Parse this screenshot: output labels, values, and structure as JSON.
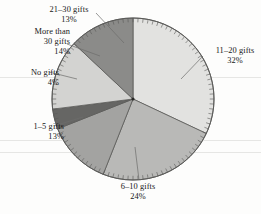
{
  "chart_data": {
    "type": "pie",
    "title": "",
    "xlabel": "",
    "ylabel": "",
    "legend_position": "none",
    "grid": false,
    "note": "Grayscale pie chart with radial tick marks around the rim and leader-line callout labels.",
    "categories": [
      "11–20 gifts",
      "6–10 gifts",
      "1–5 gifts",
      "No gifts",
      "More than 30 gifts",
      "21–30 gifts"
    ],
    "values": [
      32,
      24,
      13,
      4,
      14,
      13
    ],
    "value_unit": "%",
    "slices": [
      {
        "label": "11–20 gifts",
        "percent_label": "32%",
        "value": 32,
        "color": "#e2e2e0",
        "start_angle_deg": 0,
        "end_angle_deg": 115.2
      },
      {
        "label": "6–10 gifts",
        "percent_label": "24%",
        "value": 24,
        "color": "#b9b9b7",
        "start_angle_deg": 115.2,
        "end_angle_deg": 201.6
      },
      {
        "label": "1–5 gifts",
        "percent_label": "13%",
        "value": 13,
        "color": "#a3a3a1",
        "start_angle_deg": 201.6,
        "end_angle_deg": 248.4
      },
      {
        "label": "No gifts",
        "percent_label": "4%",
        "value": 4,
        "color": "#666664",
        "start_angle_deg": 248.4,
        "end_angle_deg": 262.8
      },
      {
        "label": "More than 30 gifts",
        "percent_label": "14%",
        "value": 14,
        "color": "#d3d3d1",
        "start_angle_deg": 262.8,
        "end_angle_deg": 313.2
      },
      {
        "label": "21–30 gifts",
        "percent_label": "13%",
        "value": 13,
        "color": "#8b8b89",
        "start_angle_deg": 313.2,
        "end_angle_deg": 360
      }
    ]
  },
  "labels": {
    "gifts_21_30": {
      "name": "21–30 gifts",
      "percent": "13%"
    },
    "more_than_30": {
      "name_line1": "More than",
      "name_line2": "30 gifts",
      "percent": "14%"
    },
    "no_gifts": {
      "name": "No gifts",
      "percent": "4%"
    },
    "gifts_1_5": {
      "name": "1–5 gifts",
      "percent": "13%"
    },
    "gifts_6_10": {
      "name": "6–10 gifts",
      "percent": "24%"
    },
    "gifts_11_20": {
      "name": "11–20 gifts",
      "percent": "32%"
    }
  },
  "colors": {
    "background": "#fdfdfc",
    "outline": "#5a5a58",
    "text": "#171717",
    "leader_line": "#6d6d6b"
  }
}
